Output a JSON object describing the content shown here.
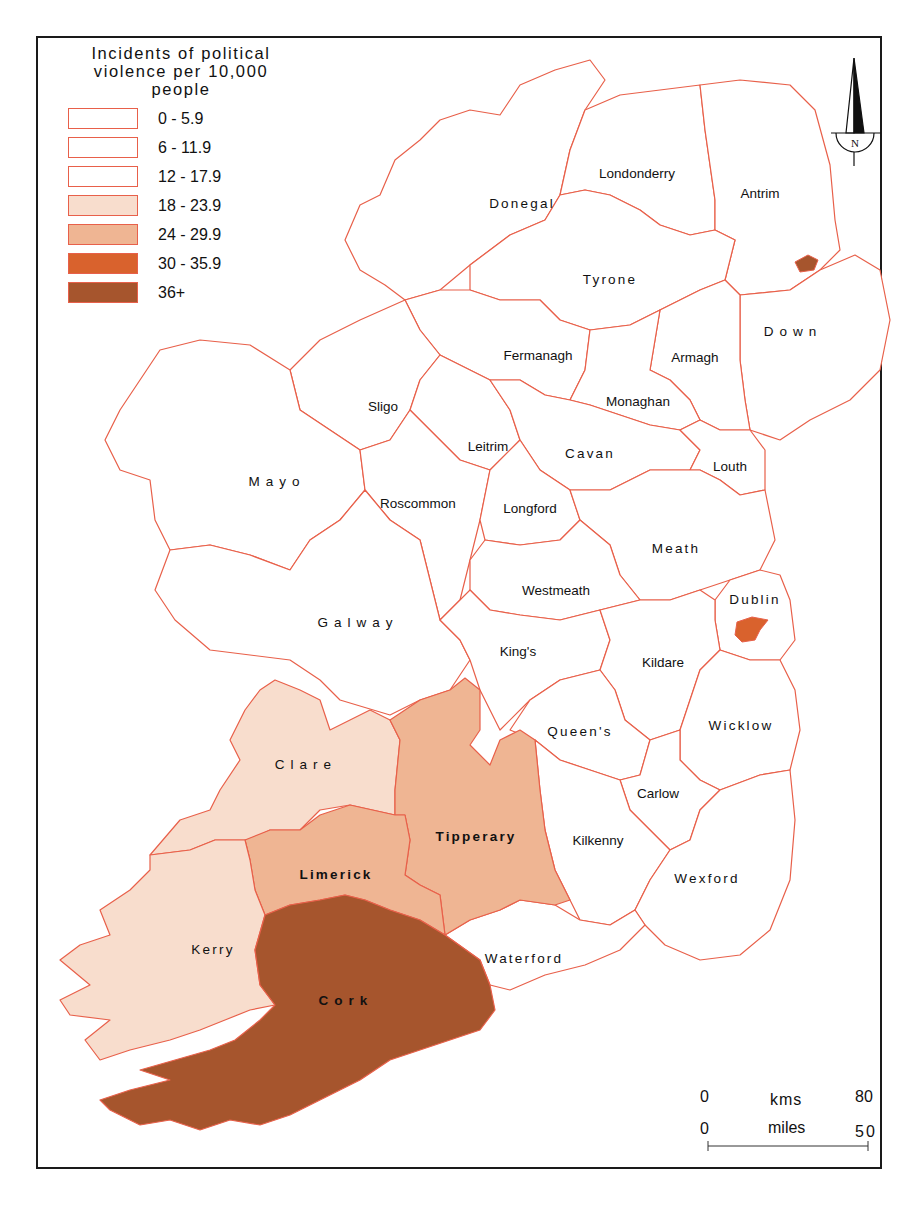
{
  "legend": {
    "title_lines": [
      "Incidents of political",
      "violence per 10,000",
      "people"
    ],
    "classes": [
      {
        "label": "0 - 5.9",
        "color": "#ffffff"
      },
      {
        "label": "6 - 11.9",
        "color": "#ffffff"
      },
      {
        "label": "12 - 17.9",
        "color": "#ffffff"
      },
      {
        "label": "18 - 23.9",
        "color": "#f8ddcd"
      },
      {
        "label": "24 - 29.9",
        "color": "#efb593"
      },
      {
        "label": "30 - 35.9",
        "color": "#d9622d"
      },
      {
        "label": "36+",
        "color": "#a6552d"
      }
    ]
  },
  "north_arrow": {
    "label": "N"
  },
  "scale_bar": {
    "kms_start": "0",
    "kms_label": "kms",
    "kms_end": "80",
    "miles_start": "0",
    "miles_label": "miles",
    "miles_end": "50"
  },
  "counties": {
    "donegal": "Donegal",
    "londonderry": "Londonderry",
    "antrim": "Antrim",
    "tyrone": "Tyrone",
    "down": "Down",
    "fermanagh": "Fermanagh",
    "armagh": "Armagh",
    "monaghan": "Monaghan",
    "sligo": "Sligo",
    "leitrim": "Leitrim",
    "cavan": "Cavan",
    "louth": "Louth",
    "mayo": "Mayo",
    "roscommon": "Roscommon",
    "longford": "Longford",
    "meath": "Meath",
    "westmeath": "Westmeath",
    "dublin": "Dublin",
    "galway": "Galway",
    "kings": "King's",
    "kildare": "Kildare",
    "queens": "Queen's",
    "wicklow": "Wicklow",
    "clare": "Clare",
    "carlow": "Carlow",
    "tipperary": "Tipperary",
    "kilkenny": "Kilkenny",
    "limerick": "Limerick",
    "wexford": "Wexford",
    "kerry": "Kerry",
    "waterford": "Waterford",
    "cork": "Cork"
  },
  "colors": {
    "boundary": "#e8604a",
    "class_18_23": "#f8ddcd",
    "class_24_29": "#efb593",
    "class_30_35": "#d9622d",
    "class_36_plus": "#a6552d"
  }
}
